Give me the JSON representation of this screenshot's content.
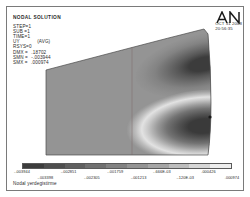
{
  "window": {
    "title": "ANSYS Graphics Window",
    "background": "#ffffff",
    "frame_color": "#7a7a7a"
  },
  "info": {
    "title": "NODAL SOLUTION",
    "rows": [
      {
        "label": "STEP=1",
        "value": "",
        "note": ""
      },
      {
        "label": "SUB =1",
        "value": "",
        "note": ""
      },
      {
        "label": "TIME=1",
        "value": "",
        "note": ""
      },
      {
        "label": "UY",
        "value": "",
        "note": "(AVG)"
      },
      {
        "label": "RSYS=0",
        "value": "",
        "note": ""
      },
      {
        "label": "DMX =",
        "value": ".18702",
        "note": ""
      },
      {
        "label": "SMN =",
        "value": "-.003944",
        "note": ""
      },
      {
        "label": "SMX =",
        "value": ".000974",
        "note": ""
      }
    ]
  },
  "logo": {
    "name": "ansys-an-logo",
    "text": "AN"
  },
  "stamp": {
    "date": "OCT 31 2008",
    "time": "20:56:35"
  },
  "caption": {
    "text": "Nodal yerdegistirme"
  },
  "chart_data": {
    "type": "heatmap",
    "title": "NODAL SOLUTION",
    "quantity": "UY",
    "units": "",
    "xlabel": "",
    "ylabel": "",
    "legend_position": "bottom",
    "grid": false,
    "colormap": "grayscale",
    "min": -0.003944,
    "max": 0.000974,
    "bands": [
      {
        "index": 0,
        "color": "#3c3c3c",
        "from": -0.003944,
        "to": -0.003398
      },
      {
        "index": 1,
        "color": "#4e4e4e",
        "from": -0.003398,
        "to": -0.002851
      },
      {
        "index": 2,
        "color": "#5f5f5f",
        "from": -0.002851,
        "to": -0.002305
      },
      {
        "index": 3,
        "color": "#707070",
        "from": -0.002305,
        "to": -0.001759
      },
      {
        "index": 4,
        "color": "#828282",
        "from": -0.001759,
        "to": -0.001213
      },
      {
        "index": 5,
        "color": "#949494",
        "from": -0.001213,
        "to": -0.666666
      },
      {
        "index": 6,
        "color": "#a6a6a6",
        "from": -0.000666,
        "to": -0.00012
      },
      {
        "index": 7,
        "color": "#bdbdbd",
        "from": -0.00012,
        "to": 0.000426
      },
      {
        "index": 8,
        "color": "#d6d6d6",
        "from": 0.000426,
        "to": 0.0007
      },
      {
        "index": 9,
        "color": "#eeeeee",
        "from": 0.0007,
        "to": 0.000974
      }
    ],
    "tick_labels_top": [
      "-.003944",
      "-.003335",
      "-.00188 ",
      "-.00188",
      "-.00079",
      "-.000374",
      "-.000944"
    ],
    "ticks": [
      {
        "text": "-.003944",
        "pos": 0.0,
        "row": "top"
      },
      {
        "text": "-.003398",
        "pos": 0.111,
        "row": "bot"
      },
      {
        "text": "-.002851",
        "pos": 0.222,
        "row": "top"
      },
      {
        "text": "-.002305",
        "pos": 0.333,
        "row": "bot"
      },
      {
        "text": "-.001759",
        "pos": 0.444,
        "row": "top"
      },
      {
        "text": "-.001213",
        "pos": 0.555,
        "row": "bot"
      },
      {
        "text": "-.666E-03",
        "pos": 0.666,
        "row": "top"
      },
      {
        "text": "-.120E-03",
        "pos": 0.777,
        "row": "bot"
      },
      {
        "text": ".000426",
        "pos": 0.888,
        "row": "top"
      },
      {
        "text": ".000974",
        "pos": 1.0,
        "row": "bot"
      }
    ]
  }
}
